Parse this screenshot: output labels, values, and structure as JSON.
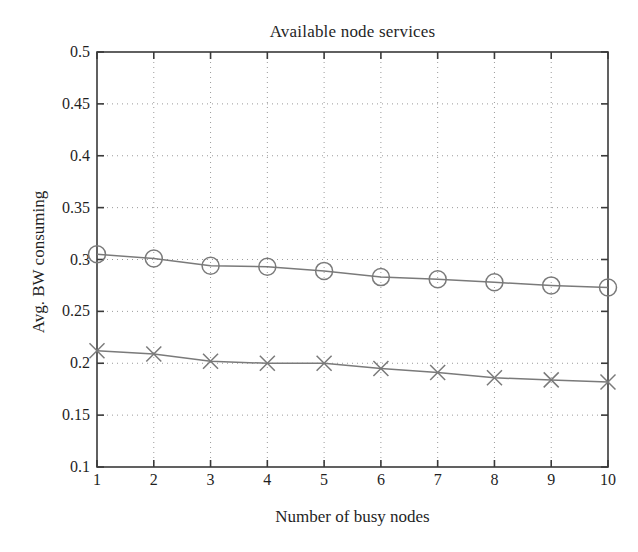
{
  "chart_data": {
    "type": "line",
    "title": "Available node services",
    "xlabel": "Number of busy nodes",
    "ylabel": "Avg. BW consuming",
    "x": [
      1,
      2,
      3,
      4,
      5,
      6,
      7,
      8,
      9,
      10
    ],
    "xlim": [
      1,
      10
    ],
    "ylim": [
      0.1,
      0.5
    ],
    "xticks": [
      "1",
      "2",
      "3",
      "4",
      "5",
      "6",
      "7",
      "8",
      "9",
      "10"
    ],
    "yticks": [
      "0.1",
      "0.15",
      "0.2",
      "0.25",
      "0.3",
      "0.35",
      "0.4",
      "0.45",
      "0.5"
    ],
    "grid": true,
    "grid_style": "dotted",
    "legend": null,
    "series": [
      {
        "name": "Avg. BW consuming (circle series)",
        "marker": "circle",
        "color": "#7a7a7a",
        "values": [
          0.305,
          0.301,
          0.294,
          0.293,
          0.289,
          0.283,
          0.281,
          0.278,
          0.275,
          0.273
        ]
      },
      {
        "name": "Avg. BW consuming (cross series)",
        "marker": "x",
        "color": "#7a7a7a",
        "values": [
          0.212,
          0.209,
          0.202,
          0.2,
          0.2,
          0.195,
          0.191,
          0.186,
          0.184,
          0.182
        ]
      }
    ]
  },
  "figure": {
    "background": "#ffffff",
    "axis_color": "#3a3a3a",
    "grid_color": "#9b9b9b",
    "line_color": "#7a7a7a"
  }
}
